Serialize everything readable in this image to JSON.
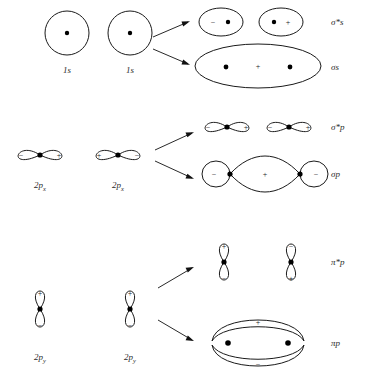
{
  "figure": {
    "stroke_color": "#1a1a1a",
    "text_color": "#2a2a2a",
    "background_color": "#ffffff"
  },
  "signs": {
    "plus": "+",
    "minus": "−"
  },
  "rows": [
    {
      "id": "row-1s",
      "atomic_label_left": "1s",
      "atomic_label_right": "1s",
      "products": [
        {
          "id": "sigma-star-s",
          "label": "σ*s",
          "kind": "antibonding"
        },
        {
          "id": "sigma-s",
          "label": "σs",
          "kind": "bonding"
        }
      ]
    },
    {
      "id": "row-2px",
      "atomic_label_left": "2p",
      "atomic_sub_left": "x",
      "atomic_label_right": "2p",
      "atomic_sub_right": "x",
      "products": [
        {
          "id": "sigma-star-p",
          "label": "σ*p",
          "kind": "antibonding"
        },
        {
          "id": "sigma-p",
          "label": "σp",
          "kind": "bonding"
        }
      ]
    },
    {
      "id": "row-2py",
      "atomic_label_left": "2p",
      "atomic_sub_left": "y",
      "atomic_label_right": "2p",
      "atomic_sub_right": "y",
      "products": [
        {
          "id": "pi-star-p",
          "label": "π*p",
          "kind": "antibonding"
        },
        {
          "id": "pi-p",
          "label": "πp",
          "kind": "bonding"
        }
      ]
    }
  ],
  "labels": {
    "ao_1s_left": "1s",
    "ao_1s_right": "1s",
    "ao_2px_left": "2p",
    "ao_2px_left_sub": "x",
    "ao_2px_right": "2p",
    "ao_2px_right_sub": "x",
    "ao_2py_left": "2p",
    "ao_2py_left_sub": "y",
    "ao_2py_right": "2p",
    "ao_2py_right_sub": "y",
    "mo_sigma_star_s": "σ*s",
    "mo_sigma_s": "σs",
    "mo_sigma_star_p": "σ*p",
    "mo_sigma_p": "σp",
    "mo_pi_star_p": "π*p",
    "mo_pi_p": "πp"
  },
  "orbital_signs": {
    "s_left_atom": "",
    "s_right_atom": "",
    "sigma_star_s_left_lobe": "−",
    "sigma_star_s_right_lobe": "+",
    "sigma_s_center": "+",
    "px_left_atom_left_lobe": "−",
    "px_left_atom_right_lobe": "+",
    "px_right_atom_left_lobe": "+",
    "px_right_atom_right_lobe": "−",
    "sigma_star_p_lobe_1": "−",
    "sigma_star_p_lobe_2": "+",
    "sigma_star_p_lobe_3": "−",
    "sigma_star_p_lobe_4": "+",
    "sigma_p_left_lobe": "−",
    "sigma_p_center_lobe": "+",
    "sigma_p_right_lobe": "−",
    "py_left_atom_top": "+",
    "py_left_atom_bottom": "−",
    "py_right_atom_top": "+",
    "py_right_atom_bottom": "−",
    "pi_star_p_left_top": "+",
    "pi_star_p_left_bottom": "−",
    "pi_star_p_right_top": "−",
    "pi_star_p_right_bottom": "+",
    "pi_p_top": "+",
    "pi_p_bottom": "−"
  }
}
